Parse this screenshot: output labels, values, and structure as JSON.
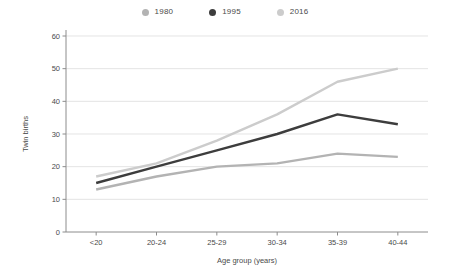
{
  "legend": {
    "position": "top-center",
    "entries": [
      {
        "label": "1980",
        "color": "#b3b3b3",
        "icon": "dot-icon"
      },
      {
        "label": "1995",
        "color": "#3d3d3d",
        "icon": "dot-icon"
      },
      {
        "label": "2016",
        "color": "#cccccc",
        "icon": "dot-icon"
      }
    ]
  },
  "chart_data": {
    "type": "line",
    "title": "",
    "xlabel": "Age group (years)",
    "ylabel": "Twin births",
    "categories": [
      "<20",
      "20-24",
      "25-29",
      "30-34",
      "35-39",
      "40-44"
    ],
    "ylim": [
      0,
      60
    ],
    "yticks": [
      0,
      10,
      20,
      30,
      40,
      50,
      60
    ],
    "ytick_labels": [
      "0",
      "10",
      "20",
      "30",
      "40",
      "50",
      "60"
    ],
    "grid": true,
    "series": [
      {
        "name": "1980",
        "color": "#b3b3b3",
        "values": [
          13,
          17,
          20,
          21,
          24,
          23
        ]
      },
      {
        "name": "1995",
        "color": "#3d3d3d",
        "values": [
          15,
          20,
          25,
          30,
          36,
          33
        ]
      },
      {
        "name": "2016",
        "color": "#cccccc",
        "values": [
          17,
          21,
          28,
          36,
          46,
          50
        ]
      }
    ]
  }
}
